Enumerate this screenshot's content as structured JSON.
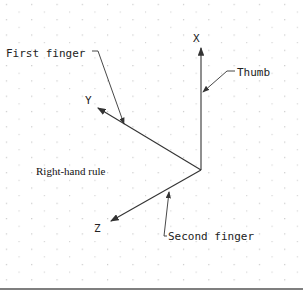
{
  "diagram": {
    "title": "Right-hand rule",
    "axes": [
      {
        "id": "x",
        "label": "X",
        "annotation": "Thumb"
      },
      {
        "id": "y",
        "label": "Y",
        "annotation": "First finger"
      },
      {
        "id": "z",
        "label": "Z",
        "annotation": "Second finger"
      }
    ],
    "colors": {
      "line": "#333333",
      "grid_dot": "#b8b8b8",
      "rule": "#555555"
    }
  }
}
